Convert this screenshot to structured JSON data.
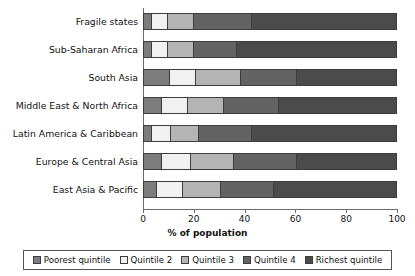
{
  "chart_data": {
    "type": "bar",
    "subtype": "stacked-horizontal-100pct",
    "title": "",
    "xlabel": "% of population",
    "ylabel": "",
    "xlim": [
      0,
      100
    ],
    "xticks": [
      0,
      20,
      40,
      60,
      80,
      100
    ],
    "xtick_labels": [
      "0",
      "20",
      "40",
      "60",
      "80",
      "100"
    ],
    "grid": false,
    "legend_position": "bottom",
    "categories": [
      "Fragile states",
      "Sub-Saharan Africa",
      "South Asia",
      "Middle East & North Africa",
      "Latin America & Caribbean",
      "Europe & Central Asia",
      "East Asia & Pacific"
    ],
    "series": [
      {
        "name": "Poorest quintile",
        "color": "#7c7c7c",
        "values": [
          3,
          3,
          10,
          7,
          3,
          7,
          5
        ]
      },
      {
        "name": "Quintile 2",
        "color": "#f1f1f1",
        "values": [
          6,
          6,
          10,
          10,
          7,
          11,
          10
        ]
      },
      {
        "name": "Quintile 3",
        "color": "#b4b4b4",
        "values": [
          10,
          10,
          18,
          14,
          11,
          17,
          15
        ]
      },
      {
        "name": "Quintile 4",
        "color": "#636363",
        "values": [
          23,
          17,
          22,
          22,
          21,
          25,
          21
        ]
      },
      {
        "name": "Richest quintile",
        "color": "#4b4b4b",
        "values": [
          58,
          64,
          40,
          47,
          58,
          40,
          49
        ]
      }
    ]
  },
  "legend": {
    "items": [
      {
        "label": "Poorest quintile",
        "color": "#7c7c7c"
      },
      {
        "label": "Quintile 2",
        "color": "#f1f1f1"
      },
      {
        "label": "Quintile 3",
        "color": "#b4b4b4"
      },
      {
        "label": "Quintile 4",
        "color": "#636363"
      },
      {
        "label": "Richest quintile",
        "color": "#4b4b4b"
      }
    ]
  }
}
